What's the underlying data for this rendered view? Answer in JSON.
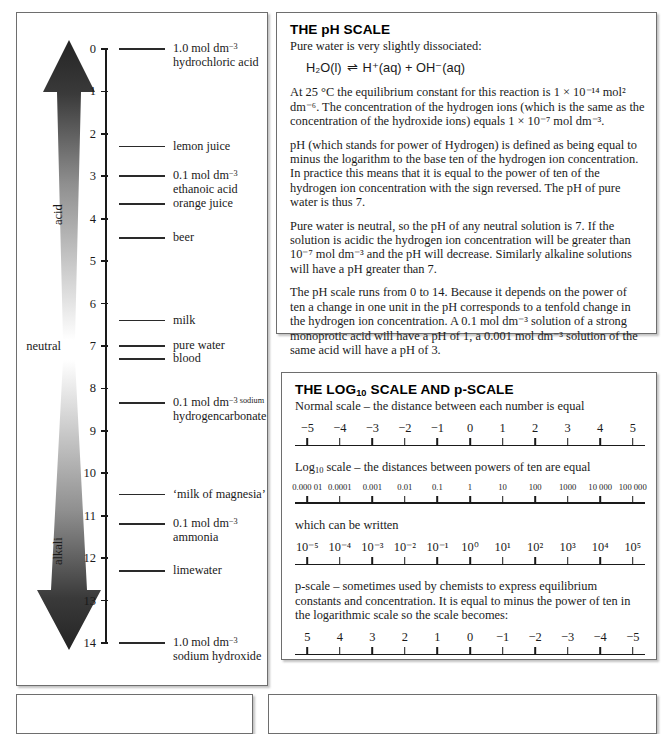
{
  "ph_scale": {
    "axis": {
      "min": 0,
      "max": 14
    },
    "tick_labels": [
      "0",
      "1",
      "2",
      "3",
      "4",
      "5",
      "6",
      "7",
      "8",
      "9",
      "10",
      "11",
      "12",
      "13",
      "14"
    ],
    "neutral_label": "neutral",
    "acid_label": "acid",
    "alkali_label": "alkali",
    "substances": [
      {
        "ph": 0.0,
        "line1": "1.0 mol dm",
        "sup1": "−3",
        "line2": "hydrochloric acid"
      },
      {
        "ph": 2.3,
        "line1": "lemon juice",
        "sup1": "",
        "line2": ""
      },
      {
        "ph": 3.0,
        "line1": "0.1 mol dm",
        "sup1": "−3",
        "line2": "ethanoic acid"
      },
      {
        "ph": 3.65,
        "line1": "orange juice",
        "sup1": "",
        "line2": ""
      },
      {
        "ph": 4.45,
        "line1": "beer",
        "sup1": "",
        "line2": ""
      },
      {
        "ph": 6.4,
        "line1": "milk",
        "sup1": "",
        "line2": ""
      },
      {
        "ph": 7.0,
        "line1": "pure water",
        "sup1": "",
        "line2": ""
      },
      {
        "ph": 7.3,
        "line1": "blood",
        "sup1": "",
        "line2": ""
      },
      {
        "ph": 8.35,
        "line1": "0.1 mol dm",
        "sup1": "−3 sodium",
        "line2": "hydrogencarbonate"
      },
      {
        "ph": 10.5,
        "line1": "‘milk of magnesia’",
        "sup1": "",
        "line2": ""
      },
      {
        "ph": 11.2,
        "line1": "0.1 mol dm",
        "sup1": "−3",
        "line2": "ammonia"
      },
      {
        "ph": 12.3,
        "line1": "limewater",
        "sup1": "",
        "line2": ""
      },
      {
        "ph": 14.0,
        "line1": "1.0 mol dm",
        "sup1": "−3",
        "line2": "sodium hydroxide"
      }
    ]
  },
  "ph_text": {
    "title": "THE pH SCALE",
    "intro": "Pure water is very slightly dissociated:",
    "equation": {
      "reactant": "H₂O(l)",
      "arrow": "⇌",
      "products": "H⁺(aq) + OH⁻(aq)"
    },
    "para1": "At 25 °C the equilibrium constant for this reaction is 1 × 10⁻¹⁴ mol² dm⁻⁶. The concentration of the hydrogen ions (which is the same as the concentration of the hydroxide ions) equals 1 × 10⁻⁷ mol dm⁻³.",
    "para2": "pH (which stands for power of Hydrogen) is defined as being equal to minus the logarithm to the base ten of the hydrogen ion concentration. In practice this means that it is equal to the power of ten of the hydrogen ion concentration with the sign reversed. The pH of pure water is thus 7.",
    "para3": "Pure water is neutral, so the pH of any neutral solution is 7. If the solution is acidic the hydrogen ion concentration will be greater than 10⁻⁷ mol dm⁻³ and the pH will decrease. Similarly alkaline solutions will have a pH greater than 7.",
    "para4": "The pH scale runs from 0 to 14. Because it depends on the power of ten a change in one unit in the pH corresponds to a tenfold change in the hydrogen ion concentration. A 0.1 mol dm⁻³ solution of a strong monoprotic acid will have a pH of 1, a 0.001 mol dm⁻³ solution of the same acid will have a pH of 3."
  },
  "log_panel": {
    "title_pre": "THE LOG",
    "title_sub": "10",
    "title_post": " SCALE AND p-SCALE",
    "caption_normal": "Normal scale – the distance between each number is equal",
    "caption_log_pre": "Log",
    "caption_log_sub": "10",
    "caption_log_post": " scale – the distances between powers of ten are equal",
    "caption_written": "which can be written",
    "caption_pscale": "p-scale – sometimes used by chemists to express equilibrium constants and concentration. It is equal to minus the power of ten in the logarithmic scale so the scale becomes:",
    "scales": {
      "normal": [
        "−5",
        "−4",
        "−3",
        "−2",
        "−1",
        "0",
        "1",
        "2",
        "3",
        "4",
        "5"
      ],
      "log10": [
        "0.000 01",
        "0.0001",
        "0.001",
        "0.01",
        "0.1",
        "1",
        "10",
        "100",
        "1000",
        "10 000",
        "100 000"
      ],
      "powers": [
        "10⁻⁵",
        "10⁻⁴",
        "10⁻³",
        "10⁻²",
        "10⁻¹",
        "10⁰",
        "10¹",
        "10²",
        "10³",
        "10⁴",
        "10⁵"
      ],
      "pscale": [
        "5",
        "4",
        "3",
        "2",
        "1",
        "0",
        "−1",
        "−2",
        "−3",
        "−4",
        "−5"
      ]
    }
  },
  "colors": {
    "ink": "#1a1a1a",
    "panel_border": "#6e6e6e",
    "arrow_dark": "#2b2b2b",
    "arrow_light": "#f2f2f2",
    "background": "#ffffff"
  }
}
